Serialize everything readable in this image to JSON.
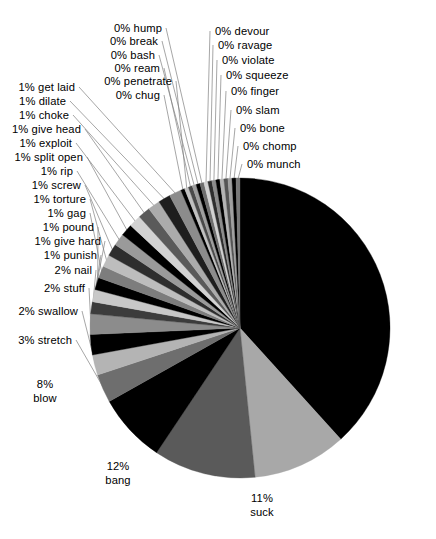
{
  "chart_data": {
    "type": "pie",
    "title": "",
    "subtitle": "",
    "xlabel": "",
    "ylabel": "",
    "legend": "none",
    "grid": false,
    "label_format": "{percent}% {name}",
    "start_angle_deg": 0,
    "direction": "clockwise",
    "total_percent": 100,
    "categories": [
      "fuck",
      "suck",
      "bang",
      "blow",
      "stretch",
      "swallow",
      "stuff",
      "nail",
      "punish",
      "give hard",
      "pound",
      "gag",
      "torture",
      "screw",
      "rip",
      "split open",
      "exploit",
      "give head",
      "choke",
      "dilate",
      "get laid",
      "chug",
      "penetrate",
      "ream",
      "bash",
      "break",
      "hump",
      "devour",
      "ravage",
      "violate",
      "squeeze",
      "finger",
      "slam",
      "bone",
      "chomp",
      "munch"
    ],
    "values": [
      43,
      11,
      12,
      8,
      3,
      2,
      2,
      2,
      1,
      1,
      1,
      1,
      1,
      1,
      1,
      1,
      1,
      1,
      1,
      1,
      1,
      0,
      0,
      0,
      0,
      0,
      0,
      0,
      0,
      0,
      0,
      0,
      0,
      0,
      0,
      0
    ],
    "slices": [
      {
        "name": "fuck",
        "percent": 43,
        "label": "43% fuck",
        "color": "#000000"
      },
      {
        "name": "suck",
        "percent": 11,
        "label": "11% suck",
        "color": "#a8a8a8"
      },
      {
        "name": "bang",
        "percent": 12,
        "label": "12% bang",
        "color": "#5a5a5a"
      },
      {
        "name": "blow",
        "percent": 8,
        "label": "8% blow",
        "color": "#000000"
      },
      {
        "name": "stretch",
        "percent": 3,
        "label": "3% stretch",
        "color": "#6e6e6e"
      },
      {
        "name": "swallow",
        "percent": 2,
        "label": "2% swallow",
        "color": "#b4b4b4"
      },
      {
        "name": "stuff",
        "percent": 2,
        "label": "2% stuff",
        "color": "#000000"
      },
      {
        "name": "nail",
        "percent": 2,
        "label": "2% nail",
        "color": "#8c8c8c"
      },
      {
        "name": "punish",
        "percent": 1,
        "label": "1% punish",
        "color": "#3c3c3c"
      },
      {
        "name": "give hard",
        "percent": 1,
        "label": "1% give hard",
        "color": "#c8c8c8"
      },
      {
        "name": "pound",
        "percent": 1,
        "label": "1% pound",
        "color": "#000000"
      },
      {
        "name": "gag",
        "percent": 1,
        "label": "1% gag",
        "color": "#7d7d7d"
      },
      {
        "name": "torture",
        "percent": 1,
        "label": "1% torture",
        "color": "#bdbdbd"
      },
      {
        "name": "screw",
        "percent": 1,
        "label": "1% screw",
        "color": "#2e2e2e"
      },
      {
        "name": "rip",
        "percent": 1,
        "label": "1% rip",
        "color": "#9a9a9a"
      },
      {
        "name": "split open",
        "percent": 1,
        "label": "1% split open",
        "color": "#000000"
      },
      {
        "name": "exploit",
        "percent": 1,
        "label": "1% exploit",
        "color": "#d2d2d2"
      },
      {
        "name": "give head",
        "percent": 1,
        "label": "1% give head",
        "color": "#5a5a5a"
      },
      {
        "name": "choke",
        "percent": 1,
        "label": "1% choke",
        "color": "#ababab"
      },
      {
        "name": "dilate",
        "percent": 1,
        "label": "1% dilate",
        "color": "#1e1e1e"
      },
      {
        "name": "get laid",
        "percent": 1,
        "label": "1% get laid",
        "color": "#8c8c8c"
      },
      {
        "name": "chug",
        "percent": 0,
        "label": "0% chug",
        "color": "#000000"
      },
      {
        "name": "penetrate",
        "percent": 0,
        "label": "0% penetrate",
        "color": "#c0c0c0"
      },
      {
        "name": "ream",
        "percent": 0,
        "label": "0% ream",
        "color": "#4a4a4a"
      },
      {
        "name": "bash",
        "percent": 0,
        "label": "0% bash",
        "color": "#9e9e9e"
      },
      {
        "name": "break",
        "percent": 0,
        "label": "0% break",
        "color": "#000000"
      },
      {
        "name": "hump",
        "percent": 0,
        "label": "0% hump",
        "color": "#6e6e6e"
      },
      {
        "name": "devour",
        "percent": 0,
        "label": "0% devour",
        "color": "#d2d2d2"
      },
      {
        "name": "ravage",
        "percent": 0,
        "label": "0% ravage",
        "color": "#2e2e2e"
      },
      {
        "name": "violate",
        "percent": 0,
        "label": "0% violate",
        "color": "#8c8c8c"
      },
      {
        "name": "squeeze",
        "percent": 0,
        "label": "0% squeeze",
        "color": "#000000"
      },
      {
        "name": "finger",
        "percent": 0,
        "label": "0% finger",
        "color": "#b4b4b4"
      },
      {
        "name": "slam",
        "percent": 0,
        "label": "0% slam",
        "color": "#555555"
      },
      {
        "name": "bone",
        "percent": 0,
        "label": "0% bone",
        "color": "#a0a0a0"
      },
      {
        "name": "chomp",
        "percent": 0,
        "label": "0% chomp",
        "color": "#000000"
      },
      {
        "name": "munch",
        "percent": 0,
        "label": "0% munch",
        "color": "#787878"
      }
    ]
  },
  "geometry": {
    "center_x": 240,
    "center_y": 328,
    "radius": 150
  },
  "labels": {
    "inner": [
      {
        "key": "fuck",
        "line1": "43%",
        "line2": "fuck",
        "x": 363,
        "y": 284
      },
      {
        "key": "suck",
        "line1": "11%",
        "line2": "suck",
        "x": 262,
        "y": 505
      },
      {
        "key": "bang",
        "line1": "12%",
        "line2": "bang",
        "x": 118,
        "y": 473
      },
      {
        "key": "blow",
        "line1": "8%",
        "line2": "blow",
        "x": 45,
        "y": 391
      }
    ],
    "left": [
      {
        "key": "stretch",
        "text": "3% stretch",
        "x": 72,
        "y": 340
      },
      {
        "key": "swallow",
        "text": "2% swallow",
        "x": 78,
        "y": 311
      },
      {
        "key": "stuff",
        "text": "2% stuff",
        "x": 85,
        "y": 288
      },
      {
        "key": "nail",
        "text": "2% nail",
        "x": 92,
        "y": 270
      },
      {
        "key": "punish",
        "text": "1% punish",
        "x": 97,
        "y": 255
      },
      {
        "key": "give hard",
        "text": "1% give hard",
        "x": 101,
        "y": 241
      },
      {
        "key": "pound",
        "text": "1% pound",
        "x": 94,
        "y": 227
      },
      {
        "key": "gag",
        "text": "1% gag",
        "x": 86,
        "y": 213
      },
      {
        "key": "torture",
        "text": "1% torture",
        "x": 86,
        "y": 199
      },
      {
        "key": "screw",
        "text": "1% screw",
        "x": 81,
        "y": 185
      },
      {
        "key": "rip",
        "text": "1% rip",
        "x": 73,
        "y": 171
      },
      {
        "key": "split open",
        "text": "1% split open",
        "x": 83,
        "y": 157
      },
      {
        "key": "exploit",
        "text": "1% exploit",
        "x": 72,
        "y": 143
      },
      {
        "key": "give head",
        "text": "1% give head",
        "x": 81,
        "y": 129
      },
      {
        "key": "choke",
        "text": "1% choke",
        "x": 69,
        "y": 115
      },
      {
        "key": "dilate",
        "text": "1% dilate",
        "x": 66,
        "y": 101
      },
      {
        "key": "get laid",
        "text": "1% get laid",
        "x": 75,
        "y": 87
      }
    ],
    "mid": [
      {
        "key": "chug",
        "text": "0% chug",
        "x": 160,
        "y": 95
      },
      {
        "key": "penetrate",
        "text": "0% penetrate",
        "x": 172,
        "y": 81
      },
      {
        "key": "ream",
        "text": "0% ream",
        "x": 160,
        "y": 68
      },
      {
        "key": "bash",
        "text": "0% bash",
        "x": 155,
        "y": 55
      },
      {
        "key": "break",
        "text": "0% break",
        "x": 158,
        "y": 41
      },
      {
        "key": "hump",
        "text": "0% hump",
        "x": 162,
        "y": 28
      }
    ],
    "right": [
      {
        "key": "devour",
        "text": "0% devour",
        "x": 215,
        "y": 31
      },
      {
        "key": "ravage",
        "text": "0% ravage",
        "x": 218,
        "y": 45
      },
      {
        "key": "violate",
        "text": "0% violate",
        "x": 222,
        "y": 60
      },
      {
        "key": "squeeze",
        "text": "0% squeeze",
        "x": 226,
        "y": 75
      },
      {
        "key": "finger",
        "text": "0% finger",
        "x": 231,
        "y": 91
      },
      {
        "key": "slam",
        "text": "0% slam",
        "x": 236,
        "y": 110
      },
      {
        "key": "bone",
        "text": "0% bone",
        "x": 240,
        "y": 128
      },
      {
        "key": "chomp",
        "text": "0% chomp",
        "x": 243,
        "y": 146
      },
      {
        "key": "munch",
        "text": "0% munch",
        "x": 247,
        "y": 164
      }
    ]
  },
  "style": {
    "leader_color": "#808080",
    "background": "#ffffff",
    "text_color": "#000000"
  }
}
